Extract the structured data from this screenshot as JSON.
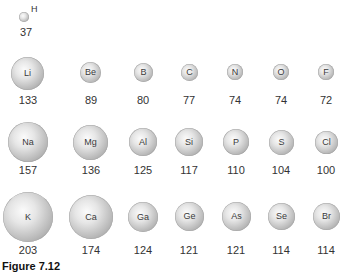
{
  "figure": {
    "caption": "Figure 7.12",
    "hydrogen": {
      "symbol": "H",
      "radius": "37"
    },
    "rows": [
      {
        "period": 2,
        "elements": [
          {
            "symbol": "Li",
            "radius": "133"
          },
          {
            "symbol": "Be",
            "radius": "89"
          },
          {
            "symbol": "B",
            "radius": "80"
          },
          {
            "symbol": "C",
            "radius": "77"
          },
          {
            "symbol": "N",
            "radius": "74"
          },
          {
            "symbol": "O",
            "radius": "74"
          },
          {
            "symbol": "F",
            "radius": "72"
          }
        ]
      },
      {
        "period": 3,
        "elements": [
          {
            "symbol": "Na",
            "radius": "157"
          },
          {
            "symbol": "Mg",
            "radius": "136"
          },
          {
            "symbol": "Al",
            "radius": "125"
          },
          {
            "symbol": "Si",
            "radius": "117"
          },
          {
            "symbol": "P",
            "radius": "110"
          },
          {
            "symbol": "S",
            "radius": "104"
          },
          {
            "symbol": "Cl",
            "radius": "100"
          }
        ]
      },
      {
        "period": 4,
        "elements": [
          {
            "symbol": "K",
            "radius": "203"
          },
          {
            "symbol": "Ca",
            "radius": "174"
          },
          {
            "symbol": "Ga",
            "radius": "124"
          },
          {
            "symbol": "Ge",
            "radius": "121"
          },
          {
            "symbol": "As",
            "radius": "121"
          },
          {
            "symbol": "Se",
            "radius": "114"
          },
          {
            "symbol": "Br",
            "radius": "114"
          }
        ]
      }
    ]
  }
}
